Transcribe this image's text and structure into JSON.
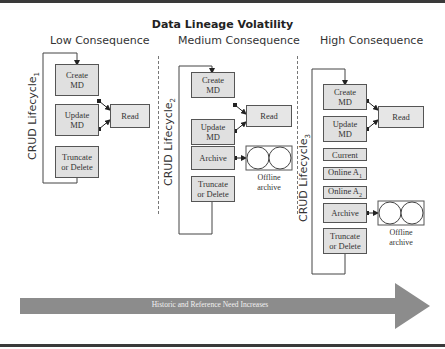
{
  "title": "Data Lineage Volatility",
  "columns": [
    {
      "heading": "Low Consequence",
      "lifecycle_label": "CRUD Lifecycle",
      "lifecycle_sub": "1",
      "boxes": [
        {
          "line1": "Create",
          "line2": "MD"
        },
        {
          "line1": "Update",
          "line2": "MD"
        },
        {
          "line1": "Truncate",
          "line2": "or Delete"
        }
      ],
      "read_label": "Read"
    },
    {
      "heading": "Medium Consequence",
      "lifecycle_label": "CRUD Lifecycle",
      "lifecycle_sub": "2",
      "boxes": [
        {
          "line1": "Create",
          "line2": "MD"
        },
        {
          "line1": "Update",
          "line2": "MD"
        },
        {
          "line1": "Archive",
          "line2": ""
        },
        {
          "line1": "Truncate",
          "line2": "or Delete"
        }
      ],
      "read_label": "Read",
      "archive_label": {
        "line1": "Offline",
        "line2": "archive"
      }
    },
    {
      "heading": "High Consequence",
      "lifecycle_label": "CRUD Lifecycle",
      "lifecycle_sub": "3",
      "boxes": [
        {
          "line1": "Create",
          "line2": "MD"
        },
        {
          "line1": "Update",
          "line2": "MD"
        },
        {
          "line1": "Current",
          "line2": ""
        },
        {
          "line1": "Online A",
          "line2": "",
          "sub": "1"
        },
        {
          "line1": "Online A",
          "line2": "",
          "sub": "2"
        },
        {
          "line1": "Archive",
          "line2": ""
        },
        {
          "line1": "Truncate",
          "line2": "or Delete"
        }
      ],
      "read_label": "Read",
      "archive_label": {
        "line1": "Offline",
        "line2": "archive"
      }
    }
  ],
  "arrow": {
    "label": "Historic and Reference Need Increases",
    "color": "#8c8c8c"
  },
  "colors": {
    "box_fill": "#e0e0e0",
    "border": "#555555",
    "rule": "#3a3a3a"
  }
}
